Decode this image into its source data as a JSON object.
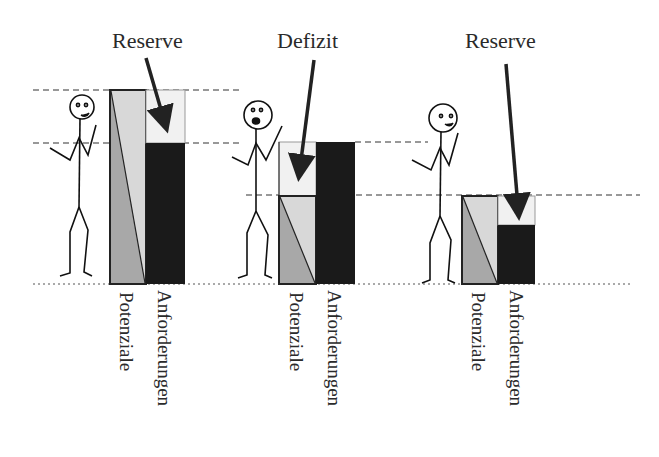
{
  "colors": {
    "demand": "#1a1a1a",
    "potential_light": "#d8d8d8",
    "potential_dark": "#a8a8a8",
    "reserve_fill": "#f1f1f1",
    "line": "#222222"
  },
  "panels": [
    {
      "callout": "Reserve",
      "bar_labels": {
        "potentials": "Potenziale",
        "demands": "Anforderungen"
      },
      "mood": "happy"
    },
    {
      "callout": "Defizit",
      "bar_labels": {
        "potentials": "Potenziale",
        "demands": "Anforderungen"
      },
      "mood": "worried"
    },
    {
      "callout": "Reserve",
      "bar_labels": {
        "potentials": "Potenziale",
        "demands": "Anforderungen"
      },
      "mood": "happy"
    }
  ]
}
